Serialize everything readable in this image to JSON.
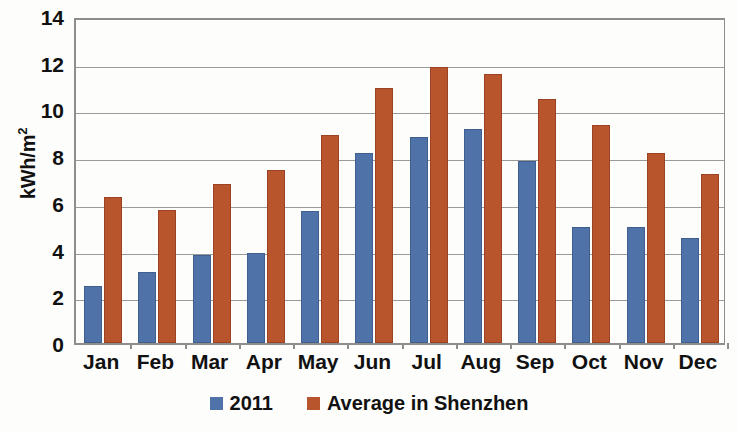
{
  "chart_data": {
    "type": "bar",
    "title": "",
    "xlabel": "",
    "ylabel": "kWh/m2",
    "ylabel_base": "kWh/m",
    "ylabel_exponent": "2",
    "ylim": [
      0,
      14
    ],
    "ytick_step": 2,
    "yticks": [
      "14",
      "12",
      "10",
      "8",
      "6",
      "4",
      "2",
      "0"
    ],
    "grid": true,
    "legend_position": "bottom-center",
    "categories": [
      "Jan",
      "Feb",
      "Mar",
      "Apr",
      "May",
      "Jun",
      "Jul",
      "Aug",
      "Sep",
      "Oct",
      "Nov",
      "Dec"
    ],
    "series": [
      {
        "name": "2011",
        "color": "#4f73a8",
        "values": [
          2.45,
          3.05,
          3.75,
          3.85,
          5.65,
          8.15,
          8.8,
          9.15,
          7.8,
          4.95,
          4.95,
          4.5
        ]
      },
      {
        "name": "Average in Shenzhen",
        "color": "#b9552c",
        "values": [
          6.25,
          5.7,
          6.8,
          7.4,
          8.9,
          10.9,
          11.8,
          11.5,
          10.45,
          9.35,
          8.15,
          7.25
        ]
      }
    ]
  },
  "colors": {
    "series_2011": "#4f73a8",
    "series_average": "#b9552c",
    "gridline": "#9a9a9a",
    "axis": "#8d8d8d",
    "background": "#fdfdfb",
    "text": "#111111"
  }
}
